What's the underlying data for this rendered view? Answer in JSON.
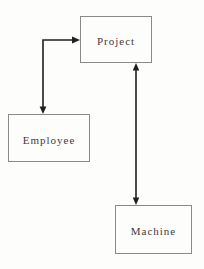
{
  "diagram": {
    "type": "relationship-diagram",
    "nodes": [
      {
        "id": "project",
        "label": "Project"
      },
      {
        "id": "employee",
        "label": "Employee"
      },
      {
        "id": "machine",
        "label": "Machine"
      }
    ],
    "edges": [
      {
        "from": "Employee",
        "to": "Project",
        "style": "elbow",
        "arrows": "both"
      },
      {
        "from": "Machine",
        "to": "Project",
        "style": "straight",
        "arrows": "both"
      }
    ]
  },
  "colors": {
    "background": "#fdfdfc",
    "box_border": "#8a8a8a",
    "arrow": "#1f1f1f",
    "text": "#3c3c3c"
  }
}
